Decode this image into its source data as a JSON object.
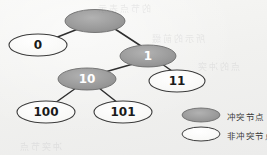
{
  "diagram": {
    "type": "binary-trie",
    "background_color": "#f1f1ef",
    "conflict_fill": "#9a9a9a",
    "nonconflict_fill": "#fdfdfc",
    "stroke_color": "#3b3b3b",
    "edge_color": "#2f2f2f",
    "nodes": [
      {
        "id": "root",
        "label": "",
        "kind": "conflict",
        "cx": 95,
        "cy": 21,
        "rx": 30,
        "ry": 11.5,
        "font_size": 11,
        "text_color": "#ffffff"
      },
      {
        "id": "n0",
        "label": "0",
        "kind": "nonconflict",
        "cx": 38,
        "cy": 45,
        "rx": 29,
        "ry": 11,
        "font_size": 12,
        "text_color": "#1a1a1a"
      },
      {
        "id": "n1",
        "label": "1",
        "kind": "conflict",
        "cx": 148,
        "cy": 56,
        "rx": 28,
        "ry": 11,
        "font_size": 12,
        "text_color": "#ffffff"
      },
      {
        "id": "n10",
        "label": "10",
        "kind": "conflict",
        "cx": 87,
        "cy": 79,
        "rx": 29,
        "ry": 11,
        "font_size": 12,
        "text_color": "#ffffff"
      },
      {
        "id": "n11",
        "label": "11",
        "kind": "nonconflict",
        "cx": 177,
        "cy": 81,
        "rx": 28,
        "ry": 11,
        "font_size": 12,
        "text_color": "#1a1a1a"
      },
      {
        "id": "n100",
        "label": "100",
        "kind": "nonconflict",
        "cx": 46,
        "cy": 112,
        "rx": 29,
        "ry": 11,
        "font_size": 12,
        "text_color": "#1a1a1a"
      },
      {
        "id": "n101",
        "label": "101",
        "kind": "nonconflict",
        "cx": 123,
        "cy": 112,
        "rx": 29,
        "ry": 11,
        "font_size": 12,
        "text_color": "#1a1a1a"
      }
    ],
    "edges": [
      {
        "id": "edge-root-0",
        "from": "root",
        "to": "n0",
        "x1": 78,
        "y1": 29,
        "x2": 55,
        "y2": 38
      },
      {
        "id": "edge-root-1",
        "from": "root",
        "to": "n1",
        "x1": 115,
        "y1": 29,
        "x2": 141,
        "y2": 46
      },
      {
        "id": "edge-1-10",
        "from": "n1",
        "to": "n10",
        "x1": 133,
        "y1": 64,
        "x2": 105,
        "y2": 72
      },
      {
        "id": "edge-1-11",
        "from": "n1",
        "to": "n11",
        "x1": 162,
        "y1": 64,
        "x2": 172,
        "y2": 71
      },
      {
        "id": "edge-10-100",
        "from": "n10",
        "to": "n100",
        "x1": 76,
        "y1": 88,
        "x2": 55,
        "y2": 103
      },
      {
        "id": "edge-10-101",
        "from": "n10",
        "to": "n101",
        "x1": 99,
        "y1": 88,
        "x2": 118,
        "y2": 103
      }
    ]
  },
  "legend": {
    "items": [
      {
        "id": "legend-conflict",
        "label": "冲突节点",
        "kind": "conflict",
        "cx": 201,
        "cy": 115,
        "rx": 19,
        "ry": 7
      },
      {
        "id": "legend-nonconflict",
        "label": "非冲突节点",
        "kind": "nonconflict",
        "cx": 201,
        "cy": 134,
        "rx": 19,
        "ry": 7
      }
    ]
  },
  "ghost_text": [
    {
      "text": "的节点表示",
      "x": 96,
      "y": 2,
      "size": 9
    },
    {
      "text": "所示的前缀",
      "x": 150,
      "y": 32,
      "size": 9
    },
    {
      "text": "点的冲突",
      "x": 196,
      "y": 60,
      "size": 9
    },
    {
      "text": "冲突节点",
      "x": 18,
      "y": 140,
      "size": 9
    }
  ]
}
